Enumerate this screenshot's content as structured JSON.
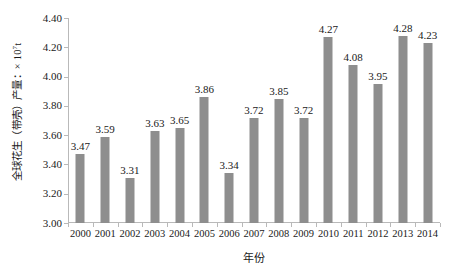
{
  "chart_data": {
    "type": "bar",
    "title": "",
    "categories": [
      "2000",
      "2001",
      "2002",
      "2003",
      "2004",
      "2005",
      "2006",
      "2007",
      "2008",
      "2009",
      "2010",
      "2011",
      "2012",
      "2013",
      "2014"
    ],
    "values": [
      3.47,
      3.59,
      3.31,
      3.63,
      3.65,
      3.86,
      3.34,
      3.72,
      3.85,
      3.72,
      4.27,
      4.08,
      3.95,
      4.28,
      4.23
    ],
    "data_labels": [
      "3.47",
      "3.59",
      "3.31",
      "3.63",
      "3.65",
      "3.86",
      "3.34",
      "3.72",
      "3.85",
      "3.72",
      "4.27",
      "4.08",
      "3.95",
      "4.28",
      "4.23"
    ],
    "xlabel": "年份",
    "ylabel_text": "全球花生（带壳）产量：× 10",
    "ylabel_exponent": "7",
    "ylabel_unit": "t",
    "ylim": [
      3.0,
      4.4
    ],
    "ytick_values": [
      4.4,
      4.2,
      4.0,
      3.8,
      3.6,
      3.4,
      3.2,
      3.0
    ],
    "ytick_labels": [
      "4.40",
      "4.20",
      "4.00",
      "3.80",
      "3.60",
      "3.40",
      "3.20",
      "3.00"
    ],
    "grid": false,
    "legend": null,
    "bar_color": "#8e8e8e",
    "axis_color": "#b9b9b9",
    "text_color": "#1a1a1a"
  }
}
